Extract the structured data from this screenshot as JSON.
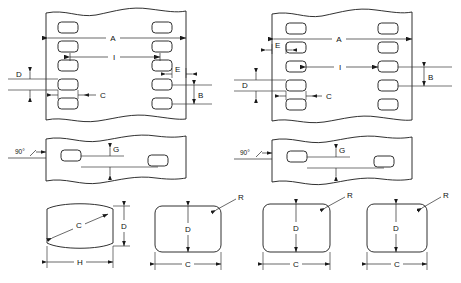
{
  "drawing": {
    "title": "Perforated Strip Dimensional Detail Drawing",
    "line_color": "#1a1a1a",
    "background_color": "#ffffff",
    "views": [
      {
        "id": "top-left-plan-view",
        "name": "staggered-hole-pattern-plan",
        "position": "top-left",
        "hole_alignment": "staggered",
        "hole_shape": "rounded-rectangle",
        "left_column_hole_count": 5,
        "right_column_hole_count": 5,
        "dimensions": [
          {
            "label": "A",
            "orientation": "horizontal",
            "meaning": "overall-width"
          },
          {
            "label": "I",
            "orientation": "horizontal",
            "meaning": "center-to-center-across"
          },
          {
            "label": "C",
            "orientation": "horizontal",
            "meaning": "hole-width"
          },
          {
            "label": "D",
            "orientation": "vertical",
            "meaning": "hole-height"
          },
          {
            "label": "E",
            "orientation": "horizontal",
            "meaning": "edge-margin"
          },
          {
            "label": "B",
            "orientation": "vertical",
            "meaning": "hole-pitch"
          }
        ]
      },
      {
        "id": "top-right-plan-view",
        "name": "aligned-hole-pattern-plan",
        "position": "top-right",
        "hole_alignment": "aligned",
        "hole_shape": "rounded-rectangle",
        "left_column_hole_count": 5,
        "right_column_hole_count": 5,
        "dimensions": [
          {
            "label": "A",
            "orientation": "horizontal",
            "meaning": "overall-width"
          },
          {
            "label": "I",
            "orientation": "horizontal",
            "meaning": "center-to-center-across"
          },
          {
            "label": "C",
            "orientation": "horizontal",
            "meaning": "hole-width"
          },
          {
            "label": "D",
            "orientation": "vertical",
            "meaning": "hole-height"
          },
          {
            "label": "E",
            "orientation": "horizontal",
            "meaning": "edge-margin"
          },
          {
            "label": "B",
            "orientation": "vertical",
            "meaning": "hole-pitch"
          }
        ]
      },
      {
        "id": "middle-left-section-view",
        "name": "side-section-staggered",
        "position": "middle-left",
        "dimensions": [
          {
            "label": "90°",
            "orientation": "angle",
            "meaning": "wall-angle"
          },
          {
            "label": "G",
            "orientation": "vertical",
            "meaning": "slot-offset"
          }
        ]
      },
      {
        "id": "middle-right-section-view",
        "name": "side-section-aligned",
        "position": "middle-right",
        "dimensions": [
          {
            "label": "90°",
            "orientation": "angle",
            "meaning": "wall-angle"
          },
          {
            "label": "G",
            "orientation": "vertical",
            "meaning": "slot-offset"
          }
        ]
      }
    ],
    "cross_sections": [
      {
        "id": "section-barrel",
        "name": "barrel-profile-section",
        "index": 1,
        "shape": "barrel",
        "labels": [
          {
            "label": "C",
            "orientation": "diagonal",
            "meaning": "diagonal-span"
          },
          {
            "label": "D",
            "orientation": "vertical",
            "meaning": "height"
          },
          {
            "label": "H",
            "orientation": "horizontal",
            "meaning": "width"
          }
        ]
      },
      {
        "id": "section-rounded-rect-wide",
        "name": "rounded-rectangle-profile-section",
        "index": 2,
        "shape": "rounded-rectangle",
        "labels": [
          {
            "label": "R",
            "orientation": "leader",
            "meaning": "corner-radius"
          },
          {
            "label": "D",
            "orientation": "vertical",
            "meaning": "height"
          },
          {
            "label": "C",
            "orientation": "horizontal",
            "meaning": "width"
          }
        ]
      },
      {
        "id": "section-rounded-rect-mid",
        "name": "rounded-rectangle-profile-section",
        "index": 3,
        "shape": "rounded-rectangle",
        "labels": [
          {
            "label": "R",
            "orientation": "leader",
            "meaning": "corner-radius"
          },
          {
            "label": "D",
            "orientation": "vertical",
            "meaning": "height"
          },
          {
            "label": "C",
            "orientation": "horizontal",
            "meaning": "width"
          }
        ]
      },
      {
        "id": "section-rounded-square",
        "name": "rounded-square-profile-section",
        "index": 4,
        "shape": "rounded-square",
        "labels": [
          {
            "label": "R",
            "orientation": "leader",
            "meaning": "corner-radius"
          },
          {
            "label": "D",
            "orientation": "vertical",
            "meaning": "height"
          },
          {
            "label": "C",
            "orientation": "horizontal",
            "meaning": "width"
          }
        ]
      }
    ],
    "labels": {
      "A": "A",
      "B": "B",
      "C": "C",
      "D": "D",
      "E": "E",
      "G": "G",
      "H": "H",
      "I": "I",
      "R": "R",
      "angle90": "90°"
    }
  }
}
